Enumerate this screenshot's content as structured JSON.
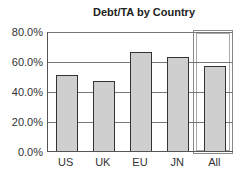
{
  "chart_data": {
    "type": "bar",
    "title": "Debt/TA by Country",
    "xlabel": "",
    "ylabel": "",
    "categories": [
      "US",
      "UK",
      "EU",
      "JN",
      "All"
    ],
    "values": [
      51,
      47,
      66,
      63,
      57
    ],
    "value_unit": "%",
    "ylim": [
      0,
      80
    ],
    "yticks": [
      "0.0%",
      "20.0%",
      "40.0%",
      "60.0%",
      "80.0%"
    ],
    "grid": true,
    "highlighted_category": "All",
    "bar_color": "#cfcfcf"
  }
}
